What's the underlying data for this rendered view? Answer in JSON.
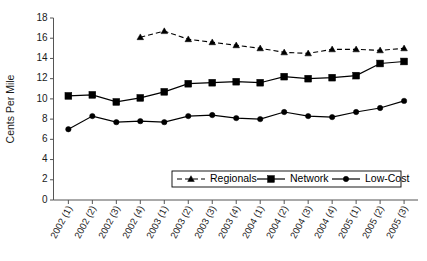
{
  "chart_data": {
    "type": "line",
    "title": "",
    "xlabel": "",
    "ylabel": "Cents Per Mile",
    "ylim": [
      0,
      18
    ],
    "ytick_step": 2,
    "grid": false,
    "legend_position": "bottom-center",
    "categories": [
      "2002 (1)",
      "2002 (2)",
      "2002 (3)",
      "2002 (4)",
      "2003 (1)",
      "2003 (2)",
      "2003 (3)",
      "2003 (4)",
      "2004 (1)",
      "2004 (2)",
      "2004 (3)",
      "2004 (4)",
      "2005 (1)",
      "2005 (2)",
      "2005 (3)"
    ],
    "ytick_labels": [
      "0",
      "2",
      "4",
      "6",
      "8",
      "10",
      "12",
      "14",
      "16",
      "18"
    ],
    "series": [
      {
        "name": "Regionals",
        "marker": "triangle",
        "line_style": "dashed",
        "color": "#000000",
        "values": [
          null,
          null,
          null,
          16.1,
          16.7,
          15.9,
          15.6,
          15.3,
          15.0,
          14.6,
          14.5,
          14.9,
          14.9,
          14.8,
          15.0
        ]
      },
      {
        "name": "Network",
        "marker": "square",
        "line_style": "solid",
        "color": "#000000",
        "values": [
          10.3,
          10.4,
          9.7,
          10.1,
          10.7,
          11.5,
          11.6,
          11.7,
          11.6,
          12.2,
          12.0,
          12.1,
          12.3,
          13.5,
          13.7
        ]
      },
      {
        "name": "Low-Cost",
        "marker": "circle",
        "line_style": "solid",
        "color": "#000000",
        "values": [
          7.0,
          8.3,
          7.7,
          7.8,
          7.7,
          8.3,
          8.4,
          8.1,
          8.0,
          8.7,
          8.3,
          8.2,
          8.7,
          9.1,
          9.8
        ]
      }
    ]
  },
  "legend": {
    "entries": [
      {
        "label": "Regionals"
      },
      {
        "label": "Network"
      },
      {
        "label": "Low-Cost"
      }
    ]
  },
  "axes": {
    "y_title": "Cents Per Mile"
  }
}
